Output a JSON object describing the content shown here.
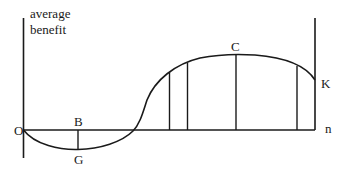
{
  "diagram": {
    "y_axis_label_line1": "average",
    "y_axis_label_line2": "benefit",
    "x_axis_label": "n",
    "points": {
      "origin": "O",
      "B": "B",
      "G": "G",
      "C": "C",
      "K": "K"
    },
    "colors": {
      "stroke": "#1a1a1a",
      "background": "#ffffff"
    }
  }
}
